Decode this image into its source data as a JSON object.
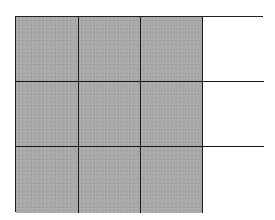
{
  "diagram": {
    "type": "fraction-grid",
    "rows": 3,
    "columns": 4,
    "total_cells": 12,
    "shaded_cells": 9,
    "shaded_color": "#a9a9a9",
    "unshaded_color": "#ffffff",
    "line_color": "#1a1a1a",
    "cells": [
      {
        "row": 0,
        "col": 0,
        "shaded": true
      },
      {
        "row": 0,
        "col": 1,
        "shaded": true
      },
      {
        "row": 0,
        "col": 2,
        "shaded": true
      },
      {
        "row": 0,
        "col": 3,
        "shaded": false
      },
      {
        "row": 1,
        "col": 0,
        "shaded": true
      },
      {
        "row": 1,
        "col": 1,
        "shaded": true
      },
      {
        "row": 1,
        "col": 2,
        "shaded": true
      },
      {
        "row": 1,
        "col": 3,
        "shaded": false
      },
      {
        "row": 2,
        "col": 0,
        "shaded": true
      },
      {
        "row": 2,
        "col": 1,
        "shaded": true
      },
      {
        "row": 2,
        "col": 2,
        "shaded": true
      },
      {
        "row": 2,
        "col": 3,
        "shaded": false
      }
    ]
  }
}
